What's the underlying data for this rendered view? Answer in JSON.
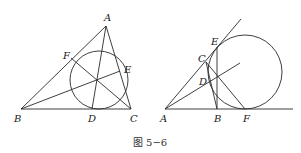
{
  "figure": {
    "caption": "图 5−6",
    "left": {
      "labels": {
        "A": "A",
        "B": "B",
        "C": "C",
        "D": "D",
        "E": "E",
        "F": "F"
      }
    },
    "right": {
      "labels": {
        "A": "A",
        "B": "B",
        "C": "C",
        "D": "D",
        "E": "E",
        "F": "F"
      }
    }
  }
}
